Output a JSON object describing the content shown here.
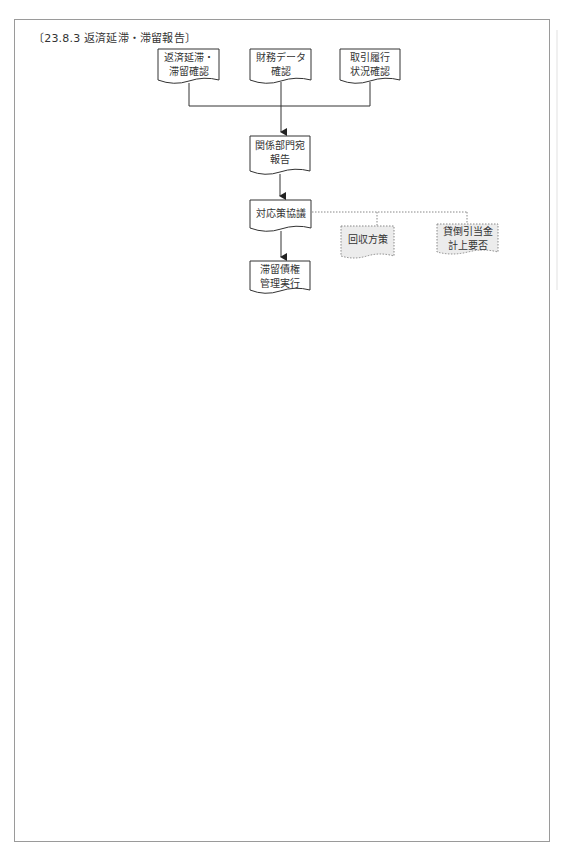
{
  "title": "〔23.8.3  返済延滞・滞留報告〕",
  "flowchart": {
    "nodes": [
      {
        "id": "n1",
        "label": "返済延滞・\n滞留確認",
        "style": "solid"
      },
      {
        "id": "n2",
        "label": "財務データ\n確認",
        "style": "solid"
      },
      {
        "id": "n3",
        "label": "取引履行\n状況確認",
        "style": "solid"
      },
      {
        "id": "n4",
        "label": "関係部門宛\n報告",
        "style": "solid"
      },
      {
        "id": "n5",
        "label": "対応策協議",
        "style": "solid"
      },
      {
        "id": "n6",
        "label": "滞留債権\n管理実行",
        "style": "solid"
      },
      {
        "id": "n7",
        "label": "回収方策",
        "style": "dotted"
      },
      {
        "id": "n8",
        "label": "貸倒引当金\n計上要否",
        "style": "dotted"
      }
    ],
    "edges": [
      {
        "from": "n1",
        "to": "n4",
        "style": "solid"
      },
      {
        "from": "n2",
        "to": "n4",
        "style": "solid"
      },
      {
        "from": "n3",
        "to": "n4",
        "style": "solid"
      },
      {
        "from": "n4",
        "to": "n5",
        "style": "solid"
      },
      {
        "from": "n5",
        "to": "n6",
        "style": "solid"
      },
      {
        "from": "n5",
        "to": "n7",
        "style": "dotted"
      },
      {
        "from": "n5",
        "to": "n8",
        "style": "dotted"
      }
    ]
  },
  "colors": {
    "line": "#333333",
    "dotted_line": "#888888",
    "dotted_fill": "#ececec",
    "frame": "#9a9a9a"
  }
}
